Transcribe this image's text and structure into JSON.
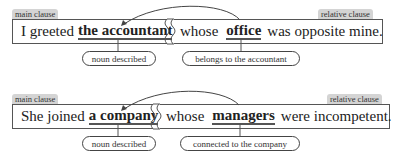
{
  "diagrams": [
    {
      "main_tag": "main clause",
      "relative_tag": "relative clause",
      "main_text_before": "I greeted",
      "main_keyword": "the accountant",
      "rel_word": "whose",
      "rel_keyword": "office",
      "rel_text_after": "was opposite mine.",
      "label_left": "noun described",
      "label_right": "belongs to the accountant"
    },
    {
      "main_tag": "main clause",
      "relative_tag": "relative clause",
      "main_text_before": "She joined",
      "main_keyword": "a company",
      "rel_word": "whose",
      "rel_keyword": "managers",
      "rel_text_after": "were incompetent.",
      "label_left": "noun described",
      "label_right": "connected to the company"
    }
  ],
  "colors": {
    "tag_bg": "#d4d4d4",
    "line": "#555555",
    "text": "#222222"
  }
}
